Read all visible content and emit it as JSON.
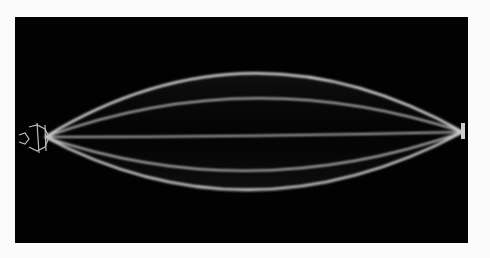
{
  "image": {
    "description": "Long-exposure photograph of a vibrating string showing standing-wave envelope lobes on black background",
    "background_color": "#020202",
    "page_color": "#fbfbfb",
    "line_color": "#d8d8d8",
    "lobes": 5
  }
}
